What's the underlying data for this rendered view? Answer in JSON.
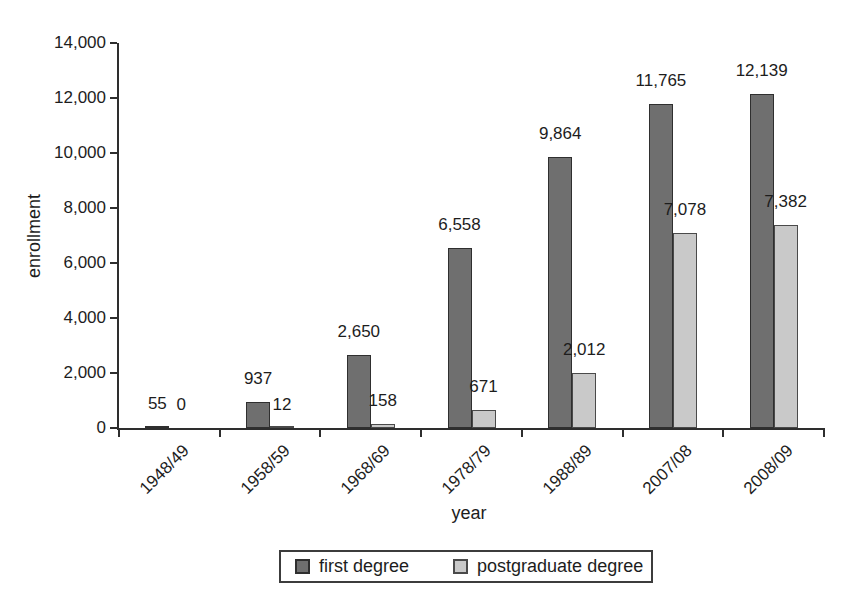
{
  "chart_data": {
    "type": "bar",
    "title": "",
    "xlabel": "year",
    "ylabel": "enrollment",
    "ylim": [
      0,
      14000
    ],
    "ytick_step": 2000,
    "grid": false,
    "legend_position": "bottom",
    "categories": [
      "1948/49",
      "1958/59",
      "1968/69",
      "1978/79",
      "1988/89",
      "2007/08",
      "2008/09"
    ],
    "y_ticks": [
      {
        "value": 0,
        "label": "0"
      },
      {
        "value": 2000,
        "label": "2,000"
      },
      {
        "value": 4000,
        "label": "4,000"
      },
      {
        "value": 6000,
        "label": "6,000"
      },
      {
        "value": 8000,
        "label": "8,000"
      },
      {
        "value": 10000,
        "label": "10,000"
      },
      {
        "value": 12000,
        "label": "12,000"
      },
      {
        "value": 14000,
        "label": "14,000"
      }
    ],
    "series": [
      {
        "name": "first degree",
        "color": "#6f6f6f",
        "border_color": "#2f2f2f",
        "values": [
          55,
          937,
          2650,
          6558,
          9864,
          11765,
          12139
        ],
        "value_labels": [
          "55",
          "937",
          "2,650",
          "6,558",
          "9,864",
          "11,765",
          "12,139"
        ]
      },
      {
        "name": "postgraduate degree",
        "color": "#c9c9c9",
        "border_color": "#4a4a4a",
        "values": [
          0,
          12,
          158,
          671,
          2012,
          7078,
          7382
        ],
        "value_labels": [
          "0",
          "12",
          "158",
          "671",
          "2,012",
          "7,078",
          "7,382"
        ]
      }
    ]
  }
}
